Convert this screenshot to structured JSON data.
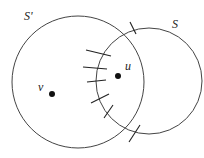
{
  "diagram": {
    "circles": [
      {
        "id": "S_prime",
        "label": "S'",
        "cx": 78,
        "cy": 82,
        "r": 66
      },
      {
        "id": "S",
        "label": "S",
        "cx": 149,
        "cy": 81,
        "r": 53
      }
    ],
    "points": [
      {
        "id": "u",
        "label": "u",
        "x": 118,
        "y": 76
      },
      {
        "id": "v",
        "label": "v",
        "x": 52,
        "y": 94
      }
    ],
    "labels": {
      "s_prime": "S'",
      "s": "S",
      "u": "u",
      "v": "v"
    },
    "ticks": [
      {
        "x1": 86,
        "y1": 50,
        "x2": 111,
        "y2": 56
      },
      {
        "x1": 83,
        "y1": 67,
        "x2": 107,
        "y2": 69
      },
      {
        "x1": 87,
        "y1": 82,
        "x2": 106,
        "y2": 80
      },
      {
        "x1": 91,
        "y1": 103,
        "x2": 109,
        "y2": 94
      },
      {
        "x1": 104,
        "y1": 118,
        "x2": 113,
        "y2": 105
      },
      {
        "x1": 130,
        "y1": 22,
        "x2": 136,
        "y2": 34
      },
      {
        "x1": 129,
        "y1": 142,
        "x2": 140,
        "y2": 125
      }
    ]
  }
}
